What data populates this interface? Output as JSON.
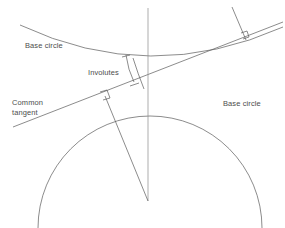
{
  "figure": {
    "background_color": "#ffffff",
    "stroke_color": "#5a5a5a",
    "text_color": "#4d4d4d",
    "width": 285,
    "height": 228
  },
  "labels": {
    "base_circle_upper": "Base circle",
    "involutes": "Involutes",
    "common_tangent": "Common\ntangent",
    "base_circle_lower": "Base circle"
  },
  "geometry": {
    "upper_base_circle": {
      "name": "upper-base-circle-arc",
      "description": "Large arc concave upward, lower boundary of upper base circle",
      "path": "M 20,25 Q 150,86 283,27"
    },
    "lower_base_circle": {
      "name": "lower-base-circle-arc",
      "description": "Dome arc of lower base circle",
      "center": [
        150,
        205
      ],
      "radius": 112,
      "path": "M 38,228 A 112,112 0 0 1 262,228"
    },
    "common_tangent": {
      "name": "common-tangent-line",
      "from": [
        13,
        127
      ],
      "to": [
        283,
        22
      ]
    },
    "center_line": {
      "name": "center-line-of-centers",
      "from": [
        148,
        8
      ],
      "to": [
        148,
        201
      ]
    },
    "lower_radius_line": {
      "name": "lower-radius-to-tangent-point",
      "from": [
        105,
        96
      ],
      "to": [
        148,
        201
      ]
    },
    "upper_radius_line": {
      "name": "upper-radius-to-tangent-point",
      "from": [
        232,
        7
      ],
      "to": [
        246,
        40
      ]
    },
    "right_angle_markers": [
      {
        "name": "right-angle-marker-lower",
        "at": [
          105,
          96
        ]
      },
      {
        "name": "right-angle-marker-upper",
        "at": [
          245,
          37
        ]
      }
    ],
    "involute_curves": [
      {
        "name": "involute-curve-left",
        "path": "M 126,55 Q 128,70 134,82"
      },
      {
        "name": "involute-curve-right",
        "path": "M 133,58 Q 138,74 144,89"
      },
      {
        "name": "involute-tick-upper",
        "path": "M 122,57 L 130,55"
      },
      {
        "name": "involute-tick-lower",
        "path": "M 130,86 L 139,83"
      }
    ],
    "arc_connectors": [
      {
        "name": "involute-base-connector",
        "path": "M 131,57 L 135,86"
      }
    ]
  }
}
